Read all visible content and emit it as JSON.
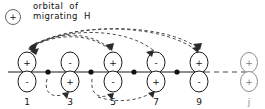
{
  "diagram": {
    "type": "orbital-migration-diagram",
    "caption": {
      "line1": "orbital  of",
      "line2": "migrating  H",
      "marker_sign": "+",
      "marker_name": "migrating-hydrogen-orbital"
    },
    "colors": {
      "ink": "#1a1a1a",
      "faint_ink": "#8a8a8a",
      "arc": "#3a3a3a",
      "background": "#ffffff"
    },
    "chain": {
      "baseline_solid_from": 8,
      "baseline_solid_to": 205,
      "baseline_dashed_from": 205,
      "baseline_dashed_to": 247,
      "baseline_y": 72
    },
    "positions": [
      {
        "id": "p1",
        "label": "1",
        "x": 27,
        "top_sign": "+",
        "bottom_sign": "-",
        "faint": false
      },
      {
        "id": "p3",
        "label": "3",
        "x": 70,
        "top_sign": "-",
        "bottom_sign": "+",
        "faint": false
      },
      {
        "id": "p5",
        "label": "5",
        "x": 113,
        "top_sign": "+",
        "bottom_sign": "-",
        "faint": false
      },
      {
        "id": "p7",
        "label": "7",
        "x": 156,
        "top_sign": "-",
        "bottom_sign": "+",
        "faint": false
      },
      {
        "id": "p9",
        "label": "9",
        "x": 199,
        "top_sign": "+",
        "bottom_sign": "-",
        "faint": false
      },
      {
        "id": "pj",
        "label": "j",
        "x": 249,
        "top_sign": "+",
        "bottom_sign": "+",
        "faint": true
      }
    ],
    "nodes": [
      {
        "id": "n1",
        "x": 48
      },
      {
        "id": "n2",
        "x": 91
      },
      {
        "id": "n3",
        "x": 134
      },
      {
        "id": "n4",
        "x": 177
      }
    ],
    "arcs": [
      {
        "id": "arc-9-to-1-upper",
        "side": "above",
        "from_label": "9",
        "to_label": "1",
        "direction": "right-to-left"
      },
      {
        "id": "arc-7-to-1-upper",
        "side": "above",
        "from_label": "7",
        "to_label": "1",
        "direction": "right-to-left"
      },
      {
        "id": "arc-5-to-1-upper",
        "side": "above",
        "from_label": "5",
        "to_label": "1",
        "direction": "right-to-left"
      },
      {
        "id": "arc-1-to-5-upper",
        "side": "above",
        "from_label": "1",
        "to_label": "5",
        "direction": "left-to-right"
      },
      {
        "id": "arc-1-to-9-upper",
        "side": "above",
        "from_label": "1",
        "to_label": "9",
        "direction": "left-to-right"
      },
      {
        "id": "arc-1-to-3-lower",
        "side": "below",
        "from_label": "1",
        "to_label": "3",
        "direction": "left-to-right"
      },
      {
        "id": "arc-5-to-7-lower",
        "side": "below",
        "from_label": "5",
        "to_label": "7",
        "direction": "left-to-right"
      },
      {
        "id": "arc-3-to-7-lower",
        "side": "below",
        "from_label": "3",
        "to_label": "7",
        "direction": "left-to-right"
      }
    ]
  }
}
